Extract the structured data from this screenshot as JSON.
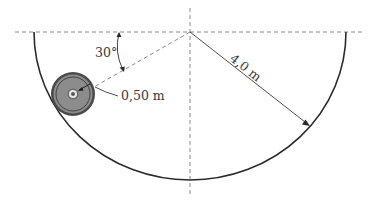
{
  "diagram": {
    "type": "physics-figure",
    "labels": {
      "angle": "30°",
      "small_radius": "0,50 m",
      "large_radius": "4,0 m"
    },
    "geometry": {
      "bowl_center": [
        190,
        32
      ],
      "bowl_radius": 150,
      "wheel_center": [
        73,
        94
      ],
      "wheel_radius": 22,
      "angle_degrees": 30
    },
    "colors": {
      "line": "#2a2a2a",
      "dashed": "#8a8a8a",
      "wheel_outer": "#4a4a4a",
      "wheel_body": "#8c8c8c",
      "text": "#3a3a3a"
    }
  }
}
